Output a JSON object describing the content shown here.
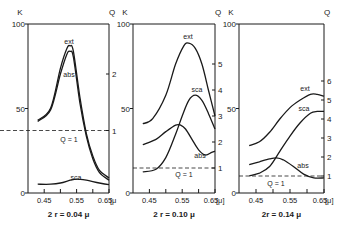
{
  "figure": {
    "ink_color": "#1a1a1a",
    "background": "#ffffff"
  },
  "chart_data": [
    {
      "type": "line",
      "title": "2 r = 0.04 μ",
      "xlabel": "[μ]",
      "ylabel_left": "K",
      "ylabel_right": "Q",
      "x_ticks": [
        "0.45",
        "0.55",
        "0.65"
      ],
      "xlim": [
        0.4,
        0.65
      ],
      "left_ticks": [
        "0",
        "50",
        "100"
      ],
      "ylim_left": [
        0,
        100
      ],
      "right_ticks": [
        "1",
        "2"
      ],
      "reference_line": {
        "label": "Q = 1",
        "value": 1,
        "style": "dashed"
      },
      "series": [
        {
          "name": "ext",
          "x": [
            0.43,
            0.47,
            0.5,
            0.52,
            0.53,
            0.54,
            0.56,
            0.58,
            0.6,
            0.62,
            0.65
          ],
          "q": [
            1.18,
            1.4,
            2.1,
            2.45,
            2.5,
            2.4,
            1.6,
            0.95,
            0.55,
            0.3,
            0.16
          ]
        },
        {
          "name": "abs",
          "x": [
            0.43,
            0.47,
            0.5,
            0.52,
            0.53,
            0.54,
            0.56,
            0.58,
            0.6,
            0.62,
            0.65
          ],
          "q": [
            1.16,
            1.37,
            2.0,
            2.35,
            2.4,
            2.3,
            1.5,
            0.9,
            0.5,
            0.26,
            0.12
          ]
        },
        {
          "name": "sca",
          "x": [
            0.43,
            0.47,
            0.5,
            0.53,
            0.55,
            0.58,
            0.62,
            0.65
          ],
          "q": [
            0.05,
            0.05,
            0.07,
            0.12,
            0.14,
            0.12,
            0.07,
            0.04
          ]
        }
      ]
    },
    {
      "type": "line",
      "title": "2 r = 0.10 μ",
      "xlabel": "[μ]",
      "ylabel_left": "K",
      "ylabel_right": "Q",
      "x_ticks": [
        "0.45",
        "0.55",
        "0.65"
      ],
      "xlim": [
        0.4,
        0.65
      ],
      "left_ticks": [
        "0",
        "50",
        "100"
      ],
      "ylim_left": [
        0,
        100
      ],
      "right_ticks": [
        "1",
        "2",
        "3",
        "4",
        "5"
      ],
      "reference_line": {
        "label": "Q = 1",
        "value": 1,
        "style": "dashed"
      },
      "series": [
        {
          "name": "ext",
          "x": [
            0.43,
            0.46,
            0.5,
            0.53,
            0.555,
            0.57,
            0.59,
            0.61,
            0.63,
            0.65
          ],
          "q": [
            2.7,
            2.9,
            3.8,
            5.0,
            5.7,
            5.8,
            5.6,
            5.0,
            4.0,
            3.0
          ]
        },
        {
          "name": "sca",
          "x": [
            0.43,
            0.47,
            0.5,
            0.53,
            0.55,
            0.57,
            0.59,
            0.61,
            0.63,
            0.65
          ],
          "q": [
            0.85,
            0.95,
            1.4,
            2.3,
            3.0,
            3.6,
            3.8,
            3.6,
            3.1,
            2.5
          ]
        },
        {
          "name": "abs",
          "x": [
            0.43,
            0.47,
            0.5,
            0.53,
            0.545,
            0.56,
            0.58,
            0.6,
            0.62,
            0.64,
            0.65
          ],
          "q": [
            1.9,
            2.1,
            2.4,
            2.65,
            2.65,
            2.5,
            2.1,
            1.7,
            1.5,
            1.6,
            1.65
          ]
        }
      ]
    },
    {
      "type": "line",
      "title": "2r = 0.14 μ",
      "xlabel": "[μ]",
      "ylabel_left": "K",
      "ylabel_right": "Q",
      "x_ticks": [
        "0.45",
        "0.55",
        "0.65"
      ],
      "xlim": [
        0.4,
        0.65
      ],
      "left_ticks": [
        "0",
        "50",
        "100"
      ],
      "ylim_left": [
        0,
        100
      ],
      "right_ticks": [
        "1",
        "2",
        "3",
        "4",
        "5",
        "6"
      ],
      "reference_line": {
        "label": "Q = 1",
        "value": 1,
        "style": "dashed"
      },
      "series": [
        {
          "name": "ext",
          "x": [
            0.43,
            0.46,
            0.49,
            0.52,
            0.55,
            0.58,
            0.61,
            0.63,
            0.65
          ],
          "q": [
            2.6,
            2.8,
            3.3,
            4.0,
            4.6,
            5.0,
            5.3,
            5.3,
            5.2
          ]
        },
        {
          "name": "sca",
          "x": [
            0.43,
            0.46,
            0.49,
            0.52,
            0.55,
            0.58,
            0.61,
            0.63,
            0.65
          ],
          "q": [
            1.0,
            1.15,
            1.5,
            2.3,
            3.1,
            3.8,
            4.3,
            4.4,
            4.4
          ]
        },
        {
          "name": "abs",
          "x": [
            0.43,
            0.46,
            0.49,
            0.51,
            0.53,
            0.56,
            0.59,
            0.62,
            0.65
          ],
          "q": [
            1.6,
            1.75,
            1.9,
            1.95,
            1.85,
            1.5,
            1.1,
            0.9,
            0.9
          ]
        }
      ]
    }
  ],
  "panels": [
    {
      "box": {
        "left": 28,
        "top": 24,
        "right": 109,
        "bottom": 193
      },
      "q_zero_y": 187,
      "q_per_unit": 56.5,
      "left_tick_labels": {
        "0": "0",
        "50": "50",
        "100": "100"
      },
      "axis_label_k": "K",
      "axis_label_q": "Q",
      "xunit": "[μ",
      "caption": "2 r = 0.04 μ",
      "ref_label": "Q = 1",
      "series_labels": [
        {
          "text": "ext",
          "x": 69,
          "y": 44
        },
        {
          "text": "abs",
          "x": 69,
          "y": 77
        },
        {
          "text": "sca",
          "x": 76,
          "y": 180
        }
      ],
      "ref_label_pos": {
        "x": 69,
        "y": 142
      }
    },
    {
      "box": {
        "left": 133,
        "top": 24,
        "right": 215,
        "bottom": 193
      },
      "q_zero_y": 194,
      "q_per_unit": 26,
      "axis_label_k": "K",
      "axis_label_q": "Q",
      "xunit": "[μ]",
      "caption": "2 r = 0.10 μ",
      "ref_label": "Q = 1",
      "series_labels": [
        {
          "text": "ext",
          "x": 188,
          "y": 39
        },
        {
          "text": "sca",
          "x": 197,
          "y": 92
        },
        {
          "text": "abs",
          "x": 200,
          "y": 158
        }
      ],
      "ref_label_pos": {
        "x": 184,
        "y": 177
      }
    },
    {
      "box": {
        "left": 239,
        "top": 24,
        "right": 324,
        "bottom": 193
      },
      "q_zero_y": 195,
      "q_per_unit": 19,
      "axis_label_k": "K",
      "axis_label_q": "Q",
      "xunit": "[μ]",
      "caption": "2r = 0.14 μ",
      "ref_label": "Q = 1",
      "series_labels": [
        {
          "text": "ext",
          "x": 305,
          "y": 91
        },
        {
          "text": "sca",
          "x": 304,
          "y": 111
        },
        {
          "text": "abs",
          "x": 303,
          "y": 168
        }
      ],
      "ref_label_pos": {
        "x": 276,
        "y": 186
      }
    }
  ]
}
